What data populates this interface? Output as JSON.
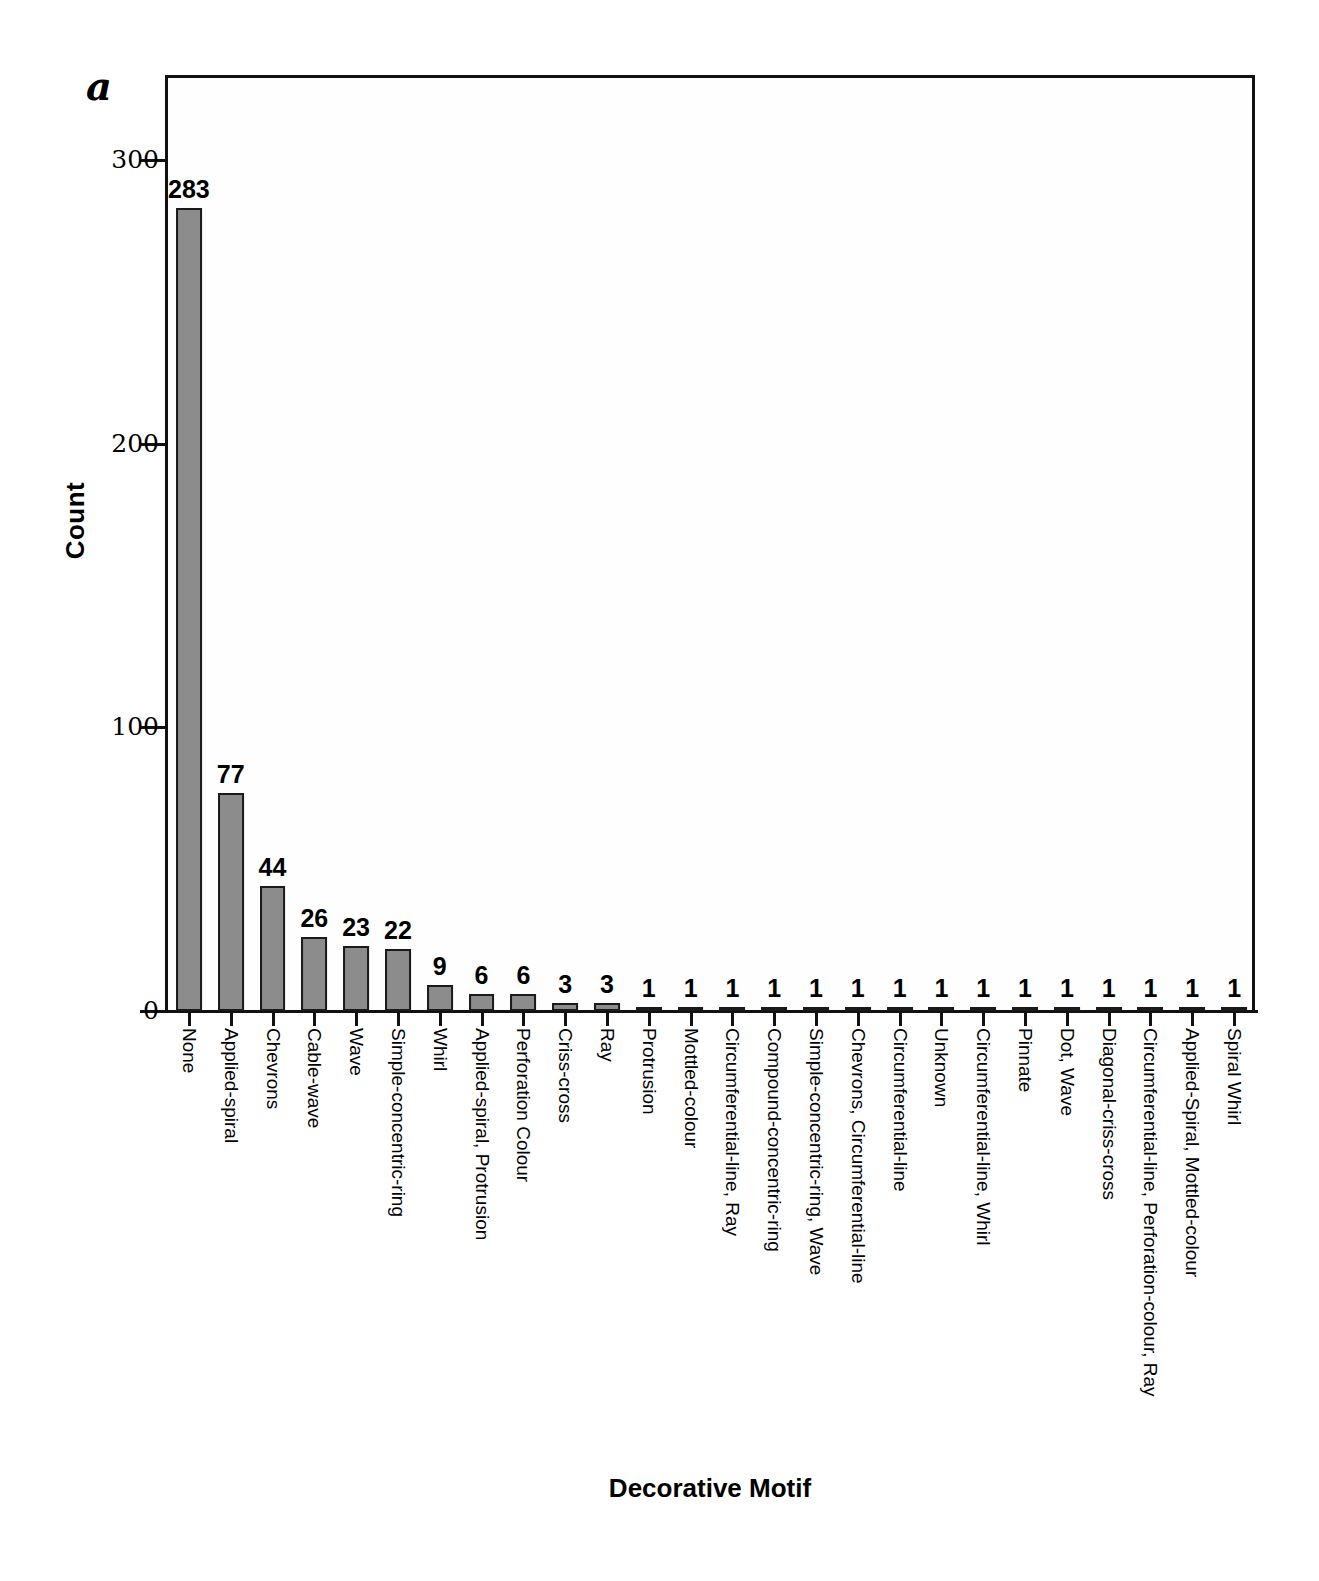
{
  "panel": {
    "letter": "a"
  },
  "axes": {
    "ylabel": "Count",
    "xlabel": "Decorative Motif",
    "yticks": [
      0,
      100,
      200,
      300
    ],
    "ytick_labels": [
      "0",
      "100",
      "200",
      "300"
    ]
  },
  "style": {
    "bar_fill": "#8c8c8c",
    "bar_stroke": "#1a1a1a",
    "axis_color": "#111111",
    "background": "#ffffff"
  },
  "chart_data": {
    "type": "bar",
    "title": "",
    "subtitle": "",
    "xlabel": "Decorative Motif",
    "ylabel": "Count",
    "ylim": [
      0,
      330
    ],
    "yticks": [
      0,
      100,
      200,
      300
    ],
    "grid": false,
    "legend": null,
    "annotations": [
      "a"
    ],
    "categories": [
      "None",
      "Applied-spiral",
      "Chevrons",
      "Cable-wave",
      "Wave",
      "Simple-concentric-ring",
      "Whirl",
      "Applied-spiral, Protrusion",
      "Perforation Colour",
      "Criss-cross",
      "Ray",
      "Protrusion",
      "Mottled-colour",
      "Circumferential-line, Ray",
      "Compound-concentric-ring",
      "Simple-concentric-ring, Wave",
      "Chevrons, Circumferential-line",
      "Circumferential-line",
      "Unknown",
      "Circumferential-line, Whirl",
      "Pinnate",
      "Dot, Wave",
      "Diagonal-criss-cross",
      "Circumferential-line, Perforation-colour, Ray",
      "Applied-Spiral, Mottled-colour",
      "Spiral Whirl"
    ],
    "values": [
      283,
      77,
      44,
      26,
      23,
      22,
      9,
      6,
      6,
      3,
      3,
      1,
      1,
      1,
      1,
      1,
      1,
      1,
      1,
      1,
      1,
      1,
      1,
      1,
      1,
      1
    ],
    "data_labels": [
      "283",
      "77",
      "44",
      "26",
      "23",
      "22",
      "9",
      "6",
      "6",
      "3",
      "3",
      "1",
      "1",
      "1",
      "1",
      "1",
      "1",
      "1",
      "1",
      "1",
      "1",
      "1",
      "1",
      "1",
      "1",
      "1"
    ]
  }
}
